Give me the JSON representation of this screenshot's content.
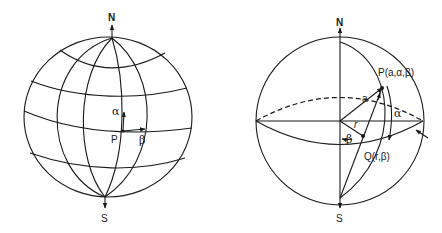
{
  "diagram": {
    "left_sphere": {
      "labels": {
        "north": "N",
        "south": "S",
        "point": "P",
        "alpha": "α",
        "beta": "β"
      },
      "description": "Globe with meridians and parallels; point P with local α (north) and β (east) direction arrows"
    },
    "right_sphere": {
      "labels": {
        "north": "N",
        "south": "S",
        "point_p": "P(a,α,β)",
        "point_q": "Q(r,β)",
        "radius": "a",
        "r": "r",
        "alpha": "α",
        "beta": "β"
      },
      "description": "Stereographic projection: point P on sphere of radius a projected from S onto equatorial plane at Q"
    },
    "colors": {
      "line": "#1a1a1a",
      "background": "#ffffff"
    }
  }
}
